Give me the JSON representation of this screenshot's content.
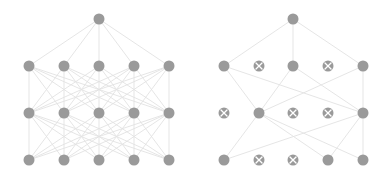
{
  "diagram": {
    "colors": {
      "node": "#9a9a9a",
      "edge": "#e2e2e2",
      "dropped_mark": "#ffffff",
      "background": "#ffffff"
    },
    "node_radius": 5.5,
    "networks": [
      {
        "name": "standard-net",
        "layers": [
          {
            "y": 160,
            "nodes": [
              {
                "x": 29
              },
              {
                "x": 64
              },
              {
                "x": 99
              },
              {
                "x": 134
              },
              {
                "x": 169
              }
            ]
          },
          {
            "y": 113,
            "nodes": [
              {
                "x": 29
              },
              {
                "x": 64
              },
              {
                "x": 99
              },
              {
                "x": 134
              },
              {
                "x": 169
              }
            ]
          },
          {
            "y": 66,
            "nodes": [
              {
                "x": 29
              },
              {
                "x": 64
              },
              {
                "x": 99
              },
              {
                "x": 134
              },
              {
                "x": 169
              }
            ]
          },
          {
            "y": 19,
            "nodes": [
              {
                "x": 99
              }
            ]
          }
        ],
        "fully_connected": true
      },
      {
        "name": "dropout-net",
        "layers": [
          {
            "y": 160,
            "nodes": [
              {
                "x": 224
              },
              {
                "x": 259,
                "dropped": true
              },
              {
                "x": 293,
                "dropped": true
              },
              {
                "x": 328
              },
              {
                "x": 363
              }
            ]
          },
          {
            "y": 113,
            "nodes": [
              {
                "x": 224,
                "dropped": true
              },
              {
                "x": 259
              },
              {
                "x": 293,
                "dropped": true
              },
              {
                "x": 328,
                "dropped": true
              },
              {
                "x": 363
              }
            ]
          },
          {
            "y": 66,
            "nodes": [
              {
                "x": 224
              },
              {
                "x": 259,
                "dropped": true
              },
              {
                "x": 293
              },
              {
                "x": 328,
                "dropped": true
              },
              {
                "x": 363
              }
            ]
          },
          {
            "y": 19,
            "nodes": [
              {
                "x": 293
              }
            ]
          }
        ],
        "fully_connected": false,
        "edges": [
          [
            [
              3,
              0
            ],
            [
              2,
              0
            ]
          ],
          [
            [
              3,
              0
            ],
            [
              2,
              2
            ]
          ],
          [
            [
              3,
              0
            ],
            [
              2,
              4
            ]
          ],
          [
            [
              2,
              0
            ],
            [
              1,
              1
            ]
          ],
          [
            [
              2,
              0
            ],
            [
              1,
              4
            ]
          ],
          [
            [
              2,
              2
            ],
            [
              1,
              1
            ]
          ],
          [
            [
              2,
              2
            ],
            [
              1,
              4
            ]
          ],
          [
            [
              2,
              4
            ],
            [
              1,
              1
            ]
          ],
          [
            [
              2,
              4
            ],
            [
              1,
              4
            ]
          ],
          [
            [
              1,
              1
            ],
            [
              0,
              0
            ]
          ],
          [
            [
              1,
              1
            ],
            [
              0,
              3
            ]
          ],
          [
            [
              1,
              1
            ],
            [
              0,
              4
            ]
          ],
          [
            [
              1,
              4
            ],
            [
              0,
              0
            ]
          ],
          [
            [
              1,
              4
            ],
            [
              0,
              3
            ]
          ],
          [
            [
              1,
              4
            ],
            [
              0,
              4
            ]
          ]
        ]
      }
    ]
  }
}
